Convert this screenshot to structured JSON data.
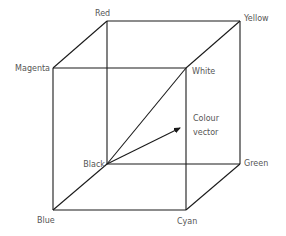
{
  "diagram": {
    "vertices": {
      "red": {
        "label": "Red",
        "x": 107,
        "y": 21
      },
      "yellow": {
        "label": "Yellow",
        "x": 240,
        "y": 21
      },
      "magenta": {
        "label": "Magenta",
        "x": 53,
        "y": 68
      },
      "white": {
        "label": "White",
        "x": 186,
        "y": 68
      },
      "black": {
        "label": "Black",
        "x": 107,
        "y": 164
      },
      "green": {
        "label": "Green",
        "x": 240,
        "y": 164
      },
      "blue": {
        "label": "Blue",
        "x": 53,
        "y": 210
      },
      "cyan": {
        "label": "Cyan",
        "x": 186,
        "y": 210
      }
    },
    "edges": [
      [
        "red",
        "yellow"
      ],
      [
        "magenta",
        "white"
      ],
      [
        "black",
        "green"
      ],
      [
        "blue",
        "cyan"
      ],
      [
        "red",
        "black"
      ],
      [
        "yellow",
        "green"
      ],
      [
        "magenta",
        "blue"
      ],
      [
        "white",
        "cyan"
      ],
      [
        "red",
        "magenta"
      ],
      [
        "yellow",
        "white"
      ],
      [
        "black",
        "blue"
      ],
      [
        "green",
        "cyan"
      ]
    ],
    "diagonal": [
      "black",
      "white"
    ],
    "vector": {
      "label_line1": "Colour",
      "label_line2": "vector",
      "from": "black",
      "to": {
        "x": 180,
        "y": 128
      }
    },
    "colors": {
      "line": "#1a1a1a",
      "label": "#555555",
      "background": "#ffffff"
    }
  }
}
